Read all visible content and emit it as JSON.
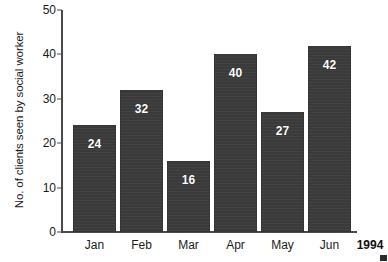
{
  "chart_data": {
    "type": "bar",
    "title": "",
    "subtitle": "",
    "xlabel": "",
    "ylabel": "No. of clients seen by social worker",
    "categories": [
      "Jan",
      "Feb",
      "Mar",
      "Apr",
      "May",
      "Jun"
    ],
    "values": [
      24,
      32,
      16,
      40,
      27,
      42
    ],
    "value_labels": [
      "24",
      "32",
      "16",
      "40",
      "27",
      "42"
    ],
    "ylim": [
      0,
      50
    ],
    "ytick_labels": [
      "0",
      "10",
      "20",
      "30",
      "40",
      "50"
    ],
    "ytick_values": [
      0,
      10,
      20,
      30,
      40,
      50
    ],
    "grid": false,
    "legend": false,
    "legend_position": "none",
    "axis_period_label": "1994",
    "colors": {
      "bar": "#3a3a3a",
      "bar_label_text": "#ffffff",
      "axis": "#4a4a4a",
      "text": "#1b1b1b",
      "background": "#ffffff"
    },
    "annotations": [
      "Value labels are printed in white inside the top of each bar.",
      "The year 1994 is printed to the right of the Jun category label on the x axis."
    ]
  }
}
